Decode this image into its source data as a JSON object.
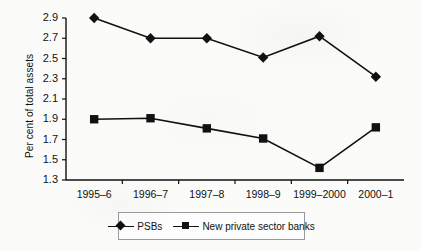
{
  "chart_data": {
    "type": "line",
    "title": "",
    "xlabel": "",
    "ylabel": "Per cent of total assets",
    "categories": [
      "1995–6",
      "1996–7",
      "1997–8",
      "1998–9",
      "1999–2000",
      "2000–1"
    ],
    "ylim": [
      1.3,
      2.9
    ],
    "yticks": [
      "1.3",
      "1.5",
      "1.7",
      "1.9",
      "2.1",
      "2.3",
      "2.5",
      "2.7",
      "2.9"
    ],
    "ytick_values": [
      1.3,
      1.5,
      1.7,
      1.9,
      2.1,
      2.3,
      2.5,
      2.7,
      2.9
    ],
    "grid": false,
    "legend_position": "bottom",
    "series": [
      {
        "name": "PSBs",
        "marker": "diamond",
        "color": "#111111",
        "values": [
          2.9,
          2.7,
          2.7,
          2.51,
          2.72,
          2.32
        ]
      },
      {
        "name": "New private sector banks",
        "marker": "square",
        "color": "#111111",
        "values": [
          1.9,
          1.91,
          1.81,
          1.71,
          1.42,
          1.82
        ]
      }
    ]
  },
  "legend": {
    "items": [
      {
        "label": "PSBs",
        "marker": "diamond"
      },
      {
        "label": "New private sector banks",
        "marker": "square"
      }
    ]
  }
}
